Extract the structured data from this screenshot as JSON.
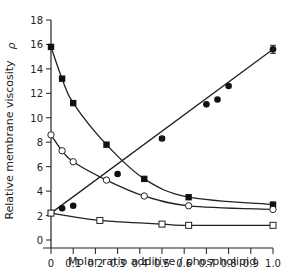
{
  "chart_data": {
    "type": "line",
    "title": "",
    "xlabel": "Molar ratio additive / phospholipid",
    "ylabel": "Relative membrane viscosity",
    "ylabel_symbol": "ρ",
    "xlim": [
      0,
      1.0
    ],
    "ylim": [
      0,
      18
    ],
    "x_ticks": [
      "0",
      "0.1",
      "0.2",
      "0.3",
      "0.4",
      "0.5",
      "0.6",
      "0.7",
      "0.8",
      "0.9",
      "1.0"
    ],
    "y_ticks": [
      "0",
      "2",
      "4",
      "6",
      "8",
      "10",
      "12",
      "14",
      "16",
      "18"
    ],
    "grid": false,
    "legend": null,
    "series": [
      {
        "name": "filled-squares",
        "marker": "filled-square",
        "x": [
          0,
          0.05,
          0.1,
          0.25,
          0.42,
          0.62,
          1.0
        ],
        "y": [
          15.8,
          13.2,
          11.2,
          7.8,
          5.0,
          3.5,
          2.9
        ]
      },
      {
        "name": "open-circles",
        "marker": "open-circle",
        "x": [
          0,
          0.05,
          0.1,
          0.25,
          0.42,
          0.62,
          1.0
        ],
        "y": [
          8.6,
          7.3,
          6.4,
          4.9,
          3.6,
          2.8,
          2.5
        ]
      },
      {
        "name": "filled-circles",
        "marker": "filled-circle",
        "x": [
          0,
          0.05,
          0.1,
          0.3,
          0.5,
          0.7,
          0.75,
          0.8,
          1.0
        ],
        "y": [
          2.2,
          2.6,
          2.8,
          5.4,
          8.3,
          11.1,
          11.5,
          12.6,
          15.6
        ]
      },
      {
        "name": "open-squares",
        "marker": "open-square",
        "x": [
          0,
          0.22,
          0.5,
          0.62,
          1.0
        ],
        "y": [
          2.2,
          1.6,
          1.3,
          1.2,
          1.2
        ]
      }
    ]
  }
}
